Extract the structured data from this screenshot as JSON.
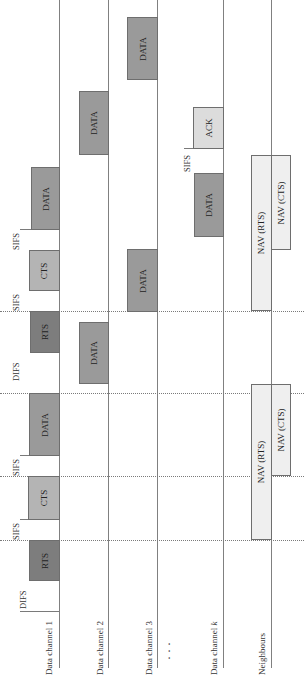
{
  "diagram": {
    "orientation": "rotated -90deg (time axis runs bottom to top)",
    "channels": [
      {
        "id": "ch1",
        "label": "Data channel 1"
      },
      {
        "id": "ch2",
        "label": "Data channel 2"
      },
      {
        "id": "ch3",
        "label": "Data channel 3"
      },
      {
        "id": "ellipsis",
        "label": "· · ·"
      },
      {
        "id": "chk",
        "label_prefix": "Data channel ",
        "label_italic": "k"
      },
      {
        "id": "neighbours",
        "label": "Neighbours"
      }
    ],
    "intervals": {
      "difs": "DIFS",
      "sifs": "SIFS"
    },
    "frames": {
      "rts": "RTS",
      "cts": "CTS",
      "data": "DATA",
      "ack": "ACK",
      "nav_rts": "NAV (RTS)",
      "nav_cts": "NAV (CTS)"
    },
    "colors": {
      "rts": "#7d7d7d",
      "data": "#9a9a9a",
      "cts": "#b4b4b4",
      "ack": "#dcdcdc",
      "nav": "#efefef",
      "line": "#808080"
    }
  }
}
